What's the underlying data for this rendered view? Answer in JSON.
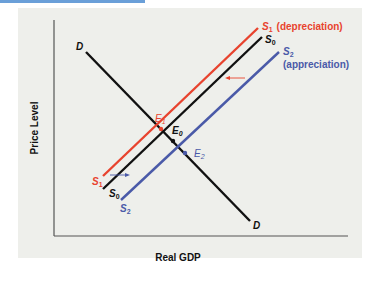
{
  "diagram": {
    "title": "",
    "axes": {
      "x_label": "Real GDP",
      "y_label": "Price Level"
    },
    "curves": {
      "demand": {
        "label": "D",
        "color": "#111111"
      },
      "s0": {
        "label": "S",
        "sub": "0",
        "color": "#111111"
      },
      "s1": {
        "label": "S",
        "sub": "1",
        "note": "(depreciation)",
        "color": "#e8432e"
      },
      "s2": {
        "label": "S",
        "sub": "2",
        "note": "(appreciation)",
        "color": "#4a5aa8"
      }
    },
    "equilibria": {
      "e0": {
        "label": "E",
        "sub": "0",
        "color": "#111111"
      },
      "e1": {
        "label": "E",
        "sub": "1",
        "color": "#e8432e"
      },
      "e2": {
        "label": "E",
        "sub": "2",
        "color": "#4a5aa8"
      }
    },
    "shift_arrows": [
      {
        "name": "depreciation-shift-arrow",
        "direction": "left",
        "color": "#e8432e"
      },
      {
        "name": "appreciation-shift-arrow",
        "direction": "right",
        "color": "#4a5aa8"
      }
    ]
  }
}
